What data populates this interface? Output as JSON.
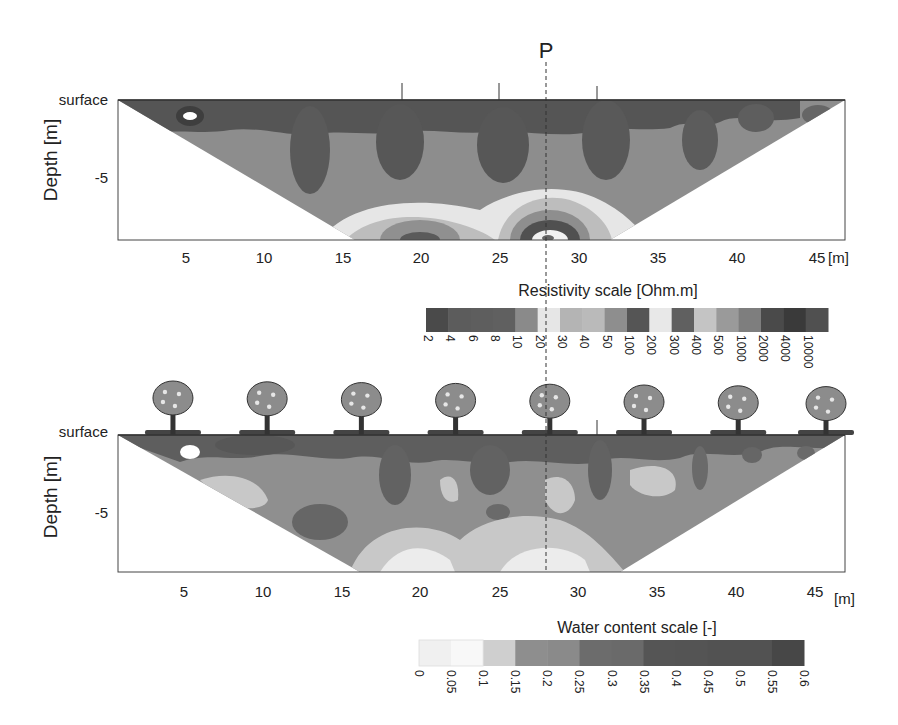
{
  "marker": {
    "label": "P",
    "x": 28
  },
  "chart_data": [
    {
      "type": "heatmap",
      "title": "Resistivity section",
      "xlabel": "[m]",
      "ylabel": "Depth [m]",
      "surface_label": "surface",
      "x_ticks": [
        5,
        10,
        15,
        20,
        25,
        30,
        35,
        40,
        45
      ],
      "y_ticks": [
        -5
      ],
      "xlim": [
        0.5,
        46.8
      ],
      "ylim": [
        -9,
        0
      ],
      "electrode_marks_x": [
        19,
        25,
        31
      ],
      "scale": {
        "title": "Resistivity scale [Ohm.m]",
        "ticks": [
          "2",
          "4",
          "6",
          "8",
          "10",
          "20",
          "30",
          "40",
          "50",
          "100",
          "200",
          "300",
          "400",
          "500",
          "1000",
          "2000",
          "4000",
          "10000"
        ],
        "colors": [
          "#4a4a4a",
          "#5c5c5c",
          "#5e5e5e",
          "#606060",
          "#8a8a8a",
          "#e6e6e6",
          "#b4b4b4",
          "#bababa",
          "#8e8e8e",
          "#555555",
          "#e8e8e8",
          "#606060",
          "#c4c4c4",
          "#9a9a9a",
          "#7e7e7e",
          "#4a4a4a",
          "#3a3a3a",
          "#505050"
        ]
      }
    },
    {
      "type": "heatmap",
      "title": "Water content section",
      "xlabel": "[m]",
      "ylabel": "Depth [m]",
      "surface_label": "surface",
      "x_ticks": [
        5,
        10,
        15,
        20,
        25,
        30,
        35,
        40,
        45
      ],
      "y_ticks": [
        -5
      ],
      "xlim": [
        0.5,
        46.8
      ],
      "ylim": [
        -9,
        0
      ],
      "electrode_marks_x": [
        31
      ],
      "tree_positions_x": [
        4,
        10,
        16,
        22,
        28,
        34,
        40,
        46
      ],
      "scale": {
        "title": "Water content scale [-]",
        "ticks": [
          "0",
          "0.05",
          "0.1",
          "0.15",
          "0.2",
          "0.25",
          "0.3",
          "0.35",
          "0.4",
          "0.45",
          "0.5",
          "0.55",
          "0.6"
        ],
        "colors": [
          "#f0f0f0",
          "#f8f8f8",
          "#cfcfcf",
          "#8e8e8e",
          "#8a8a8a",
          "#6c6c6c",
          "#6a6a6a",
          "#555555",
          "#545454",
          "#525252",
          "#525252",
          "#474747"
        ]
      }
    }
  ]
}
